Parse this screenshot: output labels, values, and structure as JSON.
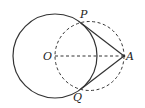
{
  "diagram": {
    "type": "geometry",
    "colors": {
      "stroke": "#333333",
      "background": "#ffffff"
    },
    "points": {
      "O": {
        "label": "O",
        "x": 55,
        "y": 56
      },
      "A": {
        "label": "A",
        "x": 124,
        "y": 56
      },
      "P": {
        "label": "P",
        "x": 81,
        "y": 23
      },
      "Q": {
        "label": "Q",
        "x": 81,
        "y": 89
      }
    },
    "circles": [
      {
        "name": "circle-O",
        "cx": 55,
        "cy": 56,
        "r": 42,
        "style": "solid"
      },
      {
        "name": "circle-OA-diameter",
        "cx": 89.5,
        "cy": 56,
        "r": 34.5,
        "style": "dashed"
      }
    ],
    "segments": [
      {
        "from": "P",
        "to": "A",
        "style": "solid"
      },
      {
        "from": "Q",
        "to": "A",
        "style": "solid"
      },
      {
        "from": "O",
        "to": "A",
        "style": "dashed"
      }
    ],
    "labels": {
      "P": "P",
      "Q": "Q",
      "O": "O",
      "A": "A"
    }
  }
}
